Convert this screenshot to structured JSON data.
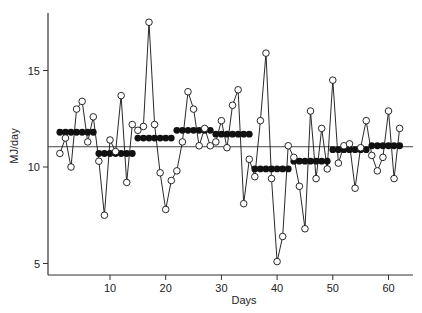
{
  "chart_data": {
    "type": "line",
    "title": "",
    "xlabel": "Days",
    "ylabel": "MJ/day",
    "xlim": [
      0,
      64
    ],
    "ylim": [
      4.4,
      18
    ],
    "xticks": [
      10,
      20,
      30,
      40,
      50,
      60
    ],
    "yticks": [
      5,
      10,
      15
    ],
    "grid": false,
    "legend": null,
    "reference_line": {
      "label": "overall mean",
      "value": 11.05
    },
    "series": [
      {
        "name": "Daily intake",
        "marker": "open-circle",
        "line": true,
        "x": [
          1,
          2,
          3,
          4,
          5,
          6,
          7,
          8,
          9,
          10,
          11,
          12,
          13,
          14,
          15,
          16,
          17,
          18,
          19,
          20,
          21,
          22,
          23,
          24,
          25,
          26,
          27,
          28,
          29,
          30,
          31,
          32,
          33,
          34,
          35,
          36,
          37,
          38,
          39,
          40,
          41,
          42,
          43,
          44,
          45,
          46,
          47,
          48,
          49,
          50,
          51,
          52,
          53,
          54,
          55,
          56,
          57,
          58,
          59,
          60,
          61,
          62
        ],
        "values": [
          10.7,
          11.5,
          10.0,
          13.0,
          13.4,
          11.3,
          12.6,
          10.3,
          7.5,
          11.4,
          10.8,
          13.7,
          9.2,
          12.2,
          11.9,
          12.1,
          17.5,
          12.2,
          9.7,
          7.8,
          9.3,
          9.8,
          11.3,
          13.9,
          13.0,
          11.1,
          12.0,
          11.1,
          11.3,
          12.4,
          11.0,
          13.2,
          14.0,
          8.1,
          10.4,
          9.5,
          12.4,
          15.9,
          9.4,
          5.1,
          6.4,
          11.1,
          10.5,
          9.0,
          6.8,
          12.9,
          9.4,
          12.0,
          9.9,
          14.5,
          10.2,
          11.1,
          11.2,
          8.9,
          11.0,
          12.4,
          10.6,
          9.8,
          10.5,
          12.9,
          9.4,
          12.0
        ]
      },
      {
        "name": "Weekly mean",
        "marker": "filled-circle",
        "line": false,
        "weeks": [
          {
            "start": 1,
            "end": 7,
            "value": 11.8
          },
          {
            "start": 8,
            "end": 14,
            "value": 10.7
          },
          {
            "start": 15,
            "end": 21,
            "value": 11.5
          },
          {
            "start": 22,
            "end": 28,
            "value": 11.9
          },
          {
            "start": 29,
            "end": 35,
            "value": 11.7
          },
          {
            "start": 36,
            "end": 42,
            "value": 9.9
          },
          {
            "start": 43,
            "end": 49,
            "value": 10.3
          },
          {
            "start": 50,
            "end": 56,
            "value": 10.9
          },
          {
            "start": 57,
            "end": 62,
            "value": 11.1
          }
        ]
      }
    ]
  },
  "colors": {
    "ink": "#111111",
    "axis": "#333333",
    "reference": "#444444",
    "background": "#ffffff"
  }
}
